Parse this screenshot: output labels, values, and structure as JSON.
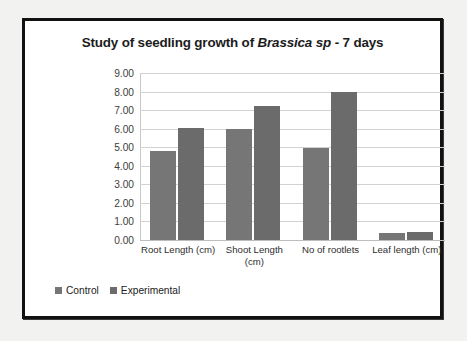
{
  "chart_data": {
    "type": "bar",
    "title": "Study of seedling growth of Brassica sp - 7 days",
    "title_plain": "Study of seedling growth of ",
    "title_italic": "Brassica sp",
    "title_tail": " - 7 days",
    "xlabel": "",
    "ylabel": "",
    "ylim": [
      0,
      9
    ],
    "ytick_labels": [
      "9.00",
      "8.00",
      "7.00",
      "6.00",
      "5.00",
      "4.00",
      "3.00",
      "2.00",
      "1.00",
      "0.00"
    ],
    "ytick_values": [
      9,
      8,
      7,
      6,
      5,
      4,
      3,
      2,
      1,
      0
    ],
    "grid": true,
    "legend_position": "bottom-left",
    "categories": [
      "Root Length (cm)",
      "Shoot Length (cm)",
      "No of rootlets",
      "Leaf length (cm)"
    ],
    "series": [
      {
        "name": "Control",
        "color": "#767676",
        "values": [
          4.8,
          6.0,
          4.95,
          0.4
        ]
      },
      {
        "name": "Experimental",
        "color": "#6b6b6b",
        "values": [
          6.05,
          7.2,
          8.0,
          0.45
        ]
      }
    ]
  }
}
